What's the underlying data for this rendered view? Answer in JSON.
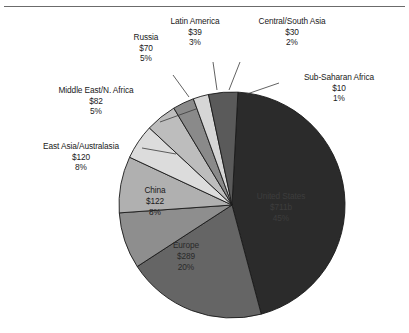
{
  "chart_data": {
    "type": "pie",
    "title": "",
    "subtitle": "",
    "xlabel": "",
    "ylabel": "",
    "legend_position": "none",
    "grid": false,
    "value_prefix": "$",
    "categories": [
      "United States",
      "Europe",
      "China",
      "East Asia/Australasia",
      "Middle East/N. Africa",
      "Russia",
      "Latin America",
      "Central/South Asia",
      "Sub-Saharan Africa"
    ],
    "values": [
      711,
      289,
      122,
      120,
      82,
      70,
      39,
      30,
      10
    ],
    "percents": [
      45,
      20,
      8,
      8,
      5,
      5,
      3,
      2,
      1
    ],
    "slices": [
      {
        "name": "United States",
        "label": "United States",
        "value_text": "$711b",
        "percent_text": "45%",
        "value": 711,
        "percent": 45,
        "color": "#2b2b2b",
        "label_placement": "inside",
        "start_angle": 3.0,
        "end_angle": 165.0
      },
      {
        "name": "Europe",
        "label": "Europe",
        "value_text": "$289",
        "percent_text": "20%",
        "value": 289,
        "percent": 20,
        "color": "#656565",
        "label_placement": "inside",
        "start_angle": 165.0,
        "end_angle": 237.0
      },
      {
        "name": "China",
        "label": "China",
        "value_text": "$122",
        "percent_text": "8%",
        "value": 122,
        "percent": 8,
        "color": "#8e8e8e",
        "label_placement": "inside",
        "start_angle": 237.0,
        "end_angle": 266.0
      },
      {
        "name": "East Asia/Australasia",
        "label": "East Asia/Australasia",
        "value_text": "$120",
        "percent_text": "8%",
        "value": 120,
        "percent": 8,
        "color": "#b0b0b0",
        "label_placement": "outside",
        "start_angle": 266.0,
        "end_angle": 295.0
      },
      {
        "name": "Middle East/N. Africa",
        "label": "Middle East/N. Africa",
        "value_text": "$82",
        "percent_text": "5%",
        "value": 82,
        "percent": 5,
        "color": "#dcdcdc",
        "label_placement": "outside",
        "start_angle": 295.0,
        "end_angle": 313.0
      },
      {
        "name": "Russia",
        "label": "Russia",
        "value_text": "$70",
        "percent_text": "5%",
        "value": 70,
        "percent": 5,
        "color": "#bdbdbd",
        "label_placement": "outside",
        "start_angle": 313.0,
        "end_angle": 329.0
      },
      {
        "name": "Latin America",
        "label": "Latin America",
        "value_text": "$39",
        "percent_text": "3%",
        "value": 39,
        "percent": 3,
        "color": "#8a8a8a",
        "label_placement": "outside",
        "start_angle": 329.0,
        "end_angle": 340.0
      },
      {
        "name": "Central/South Asia",
        "label": "Central/South Asia",
        "value_text": "$30",
        "percent_text": "2%",
        "value": 30,
        "percent": 2,
        "color": "#d6d6d6",
        "label_placement": "outside",
        "start_angle": 340.0,
        "end_angle": 348.0
      },
      {
        "name": "Sub-Saharan Africa",
        "label": "Sub-Saharan Africa",
        "value_text": "$10",
        "percent_text": "1%",
        "value": 10,
        "percent": 1,
        "color": "#5a5a5a",
        "label_placement": "outside",
        "start_angle": 348.0,
        "end_angle": 363.0
      }
    ],
    "geometry": {
      "center_x": 232,
      "center_y": 205,
      "radius": 113
    },
    "colors": {
      "outline": "#1a1a1a",
      "leader_line": "#3a3a3a",
      "rule": "#6b6b6b",
      "background": "#ffffff"
    }
  }
}
